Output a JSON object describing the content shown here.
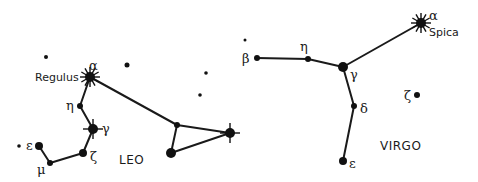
{
  "diagram": {
    "title": "",
    "constellations": [
      {
        "name": "LEO",
        "label_pos": [
          131,
          163
        ],
        "stars": [
          {
            "id": "leo-alpha",
            "greek": "α",
            "name": "Regulus",
            "x": 90,
            "y": 77,
            "r": 5,
            "type": "bright"
          },
          {
            "id": "leo-eta",
            "greek": "η",
            "x": 80,
            "y": 106,
            "r": 3,
            "type": "normal"
          },
          {
            "id": "leo-gamma",
            "greek": "γ",
            "x": 93,
            "y": 129,
            "r": 5,
            "type": "cross"
          },
          {
            "id": "leo-zeta",
            "greek": "ζ",
            "x": 83,
            "y": 153,
            "r": 4,
            "type": "normal"
          },
          {
            "id": "leo-mu",
            "greek": "μ",
            "x": 50,
            "y": 163,
            "r": 3,
            "type": "normal"
          },
          {
            "id": "leo-epsilon",
            "greek": "ε",
            "x": 39,
            "y": 146,
            "r": 4,
            "type": "normal"
          },
          {
            "id": "leo-theta",
            "greek": "",
            "x": 177,
            "y": 125,
            "r": 3,
            "type": "normal"
          },
          {
            "id": "leo-beta",
            "greek": "",
            "x": 230,
            "y": 133,
            "r": 5,
            "type": "cross"
          },
          {
            "id": "leo-delta",
            "greek": "",
            "x": 171,
            "y": 153,
            "r": 5,
            "type": "normal"
          }
        ],
        "lines": [
          [
            "leo-alpha",
            "leo-eta"
          ],
          [
            "leo-eta",
            "leo-gamma"
          ],
          [
            "leo-gamma",
            "leo-zeta"
          ],
          [
            "leo-zeta",
            "leo-mu"
          ],
          [
            "leo-mu",
            "leo-epsilon"
          ],
          [
            "leo-alpha",
            "leo-theta"
          ],
          [
            "leo-theta",
            "leo-beta"
          ],
          [
            "leo-theta",
            "leo-delta"
          ],
          [
            "leo-delta",
            "leo-beta"
          ]
        ]
      },
      {
        "name": "VIRGO",
        "label_pos": [
          380,
          150
        ],
        "stars": [
          {
            "id": "vir-alpha",
            "greek": "α",
            "name": "Spica",
            "x": 421,
            "y": 23,
            "r": 5,
            "type": "bright"
          },
          {
            "id": "vir-gamma",
            "greek": "γ",
            "x": 343,
            "y": 67,
            "r": 5,
            "type": "normal"
          },
          {
            "id": "vir-eta",
            "greek": "η",
            "x": 308,
            "y": 59,
            "r": 3,
            "type": "normal"
          },
          {
            "id": "vir-beta",
            "greek": "β",
            "x": 257,
            "y": 58,
            "r": 3,
            "type": "normal"
          },
          {
            "id": "vir-delta",
            "greek": "δ",
            "x": 354,
            "y": 106,
            "r": 3,
            "type": "normal"
          },
          {
            "id": "vir-epsilon",
            "greek": "ε",
            "x": 343,
            "y": 161,
            "r": 4,
            "type": "normal"
          },
          {
            "id": "vir-zeta",
            "greek": "ζ",
            "x": 417,
            "y": 95,
            "r": 3,
            "type": "normal"
          }
        ],
        "lines": [
          [
            "vir-beta",
            "vir-eta"
          ],
          [
            "vir-eta",
            "vir-gamma"
          ],
          [
            "vir-gamma",
            "vir-alpha"
          ],
          [
            "vir-gamma",
            "vir-delta"
          ],
          [
            "vir-delta",
            "vir-epsilon"
          ]
        ]
      }
    ],
    "field_stars": [
      {
        "x": 46,
        "y": 57,
        "r": 2
      },
      {
        "x": 127,
        "y": 65,
        "r": 2.5
      },
      {
        "x": 206,
        "y": 73,
        "r": 1.8
      },
      {
        "x": 200,
        "y": 95,
        "r": 1.8
      },
      {
        "x": 19,
        "y": 146,
        "r": 1.8
      },
      {
        "x": 245,
        "y": 40,
        "r": 1.5
      }
    ],
    "labels": [
      {
        "text": "α",
        "x": 89,
        "y": 70,
        "cls": "greek"
      },
      {
        "text": "Regulus",
        "x": 35,
        "y": 81,
        "cls": "name"
      },
      {
        "text": "η",
        "x": 66,
        "y": 110,
        "cls": "greek"
      },
      {
        "text": "γ",
        "x": 102,
        "y": 133,
        "cls": "greek"
      },
      {
        "text": "ζ",
        "x": 90,
        "y": 161,
        "cls": "greek"
      },
      {
        "text": "μ",
        "x": 37,
        "y": 174,
        "cls": "greek"
      },
      {
        "text": "ε",
        "x": 26,
        "y": 150,
        "cls": "greek"
      },
      {
        "text": "LEO",
        "x": 119,
        "y": 164,
        "cls": "const"
      },
      {
        "text": "α",
        "x": 429,
        "y": 20,
        "cls": "greek"
      },
      {
        "text": "Spica",
        "x": 429,
        "y": 36,
        "cls": "name"
      },
      {
        "text": "β",
        "x": 242,
        "y": 63,
        "cls": "greek"
      },
      {
        "text": "η",
        "x": 300,
        "y": 51,
        "cls": "greek"
      },
      {
        "text": "γ",
        "x": 350,
        "y": 79,
        "cls": "greek"
      },
      {
        "text": "δ",
        "x": 360,
        "y": 113,
        "cls": "greek"
      },
      {
        "text": "ε",
        "x": 349,
        "y": 168,
        "cls": "greek"
      },
      {
        "text": "ζ",
        "x": 404,
        "y": 100,
        "cls": "greek"
      },
      {
        "text": "VIRGO",
        "x": 380,
        "y": 150,
        "cls": "const"
      }
    ]
  }
}
